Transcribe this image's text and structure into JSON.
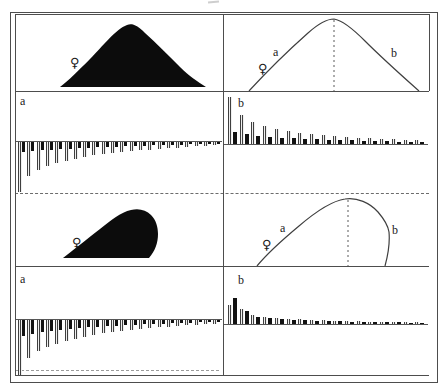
{
  "figure": {
    "background": "#ffffff",
    "frame_color": "#4d4d4d",
    "bar_solid_color": "#121212",
    "bar_hatch_dark": "#3f3f3f",
    "bar_hatch_light": "#efefef",
    "panels": {
      "top_left": {
        "name": "symmetric distribution, solid filled",
        "symbol": "♀"
      },
      "top_right": {
        "name": "symmetric distribution outline with central dashed line",
        "symbol": "♀",
        "label_a": "a",
        "label_b": "b"
      },
      "mid_left": {
        "name": "right-skewed distribution, solid filled",
        "symbol": "♀"
      },
      "mid_right": {
        "name": "right-skewed distribution outline with dashed mode line",
        "symbol": "♀",
        "label_a": "a",
        "label_b": "b"
      }
    }
  },
  "chart_data": [
    {
      "id": "upper_a",
      "type": "bar",
      "label": "a",
      "direction": "down",
      "axes_note": "no numeric tick labels visible; paired hatched/solid bars decaying in rank order, first hatched bar clipped at panel bottom",
      "series": [
        {
          "name": "hatched",
          "values": [
            50,
            34,
            28,
            24,
            21,
            19,
            17,
            15,
            13,
            12,
            11,
            10,
            9,
            8,
            8,
            7,
            6,
            6,
            5,
            4,
            4,
            3
          ]
        },
        {
          "name": "solid",
          "values": [
            10,
            9,
            8,
            8,
            7,
            7,
            6,
            6,
            5,
            5,
            5,
            4,
            4,
            4,
            3,
            3,
            3,
            3,
            2,
            2,
            2,
            2
          ]
        }
      ],
      "layout": {
        "baseline_y": 49,
        "start_x": 2,
        "pair_pitch": 9.3,
        "bar_width": 4,
        "solid_width": 3,
        "gap": 0
      }
    },
    {
      "id": "upper_b",
      "type": "bar",
      "label": "b",
      "direction": "up",
      "axes_note": "no numeric tick labels visible; paired hatched/solid bars decaying in rank order",
      "series": [
        {
          "name": "hatched",
          "values": [
            47,
            29,
            22,
            18,
            15,
            13,
            11,
            10,
            9,
            8,
            7,
            6,
            6,
            5,
            5,
            4,
            4
          ]
        },
        {
          "name": "solid",
          "values": [
            12,
            10,
            8,
            7,
            6,
            6,
            5,
            5,
            4,
            4,
            4,
            3,
            3,
            3,
            2,
            2,
            2
          ]
        }
      ],
      "layout": {
        "baseline_y": 52,
        "start_x": 4,
        "pair_pitch": 11.7,
        "bar_width": 4,
        "solid_width": 4,
        "gap": 1
      }
    },
    {
      "id": "lower_a",
      "type": "bar",
      "label": "a",
      "direction": "down",
      "axes_note": "no numeric tick labels visible; paired hatched/solid bars decaying in rank order, first hatched bar clipped at panel bottom",
      "series": [
        {
          "name": "hatched",
          "values": [
            55,
            38,
            31,
            27,
            24,
            21,
            19,
            17,
            15,
            13,
            12,
            11,
            10,
            9,
            8,
            7,
            7,
            6,
            5,
            5,
            4,
            4
          ]
        },
        {
          "name": "solid",
          "values": [
            16,
            14,
            12,
            11,
            10,
            9,
            8,
            7,
            7,
            6,
            6,
            5,
            5,
            4,
            4,
            4,
            3,
            3,
            3,
            2,
            2,
            2
          ]
        }
      ],
      "layout": {
        "baseline_y": 52,
        "start_x": 2,
        "pair_pitch": 9.3,
        "bar_width": 4,
        "solid_width": 3,
        "gap": 0
      }
    },
    {
      "id": "lower_b",
      "type": "bar",
      "label": "b",
      "direction": "up",
      "axes_note": "no numeric tick labels visible; second (solid) bar is tallest, then rapid decay",
      "series": [
        {
          "name": "hatched",
          "values": [
            19,
            15,
            9,
            7,
            6,
            5,
            5,
            4,
            4,
            3,
            3,
            3,
            2,
            2,
            2,
            2,
            2
          ]
        },
        {
          "name": "solid",
          "values": [
            26,
            13,
            7,
            6,
            5,
            4,
            4,
            3,
            3,
            3,
            2,
            2,
            2,
            2,
            2,
            1,
            1
          ]
        }
      ],
      "layout": {
        "baseline_y": 57,
        "start_x": 4,
        "pair_pitch": 11.7,
        "bar_width": 4,
        "solid_width": 4,
        "gap": 1
      }
    },
    {
      "id": "top_right_curve",
      "type": "line",
      "shape": "symmetric bell curve",
      "annotations": [
        "a on left slope",
        "b on right slope",
        "♀ near left slope",
        "vertical dashed line at peak"
      ]
    },
    {
      "id": "mid_right_curve",
      "type": "line",
      "shape": "right-skewed curve, steep right flank",
      "annotations": [
        "a on left slope",
        "b on right slope",
        "♀ near left slope",
        "vertical dashed line at mode"
      ]
    }
  ]
}
